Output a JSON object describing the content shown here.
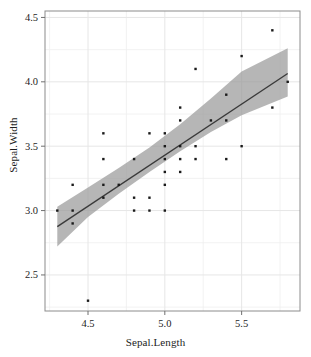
{
  "chart_data": {
    "type": "scatter",
    "title": "",
    "xlabel": "Sepal.Length",
    "ylabel": "Sepal.Width",
    "xlim": [
      4.22,
      5.88
    ],
    "ylim": [
      2.22,
      4.55
    ],
    "xticks": [
      4.5,
      5.0,
      5.5
    ],
    "xtick_labels": [
      "4.5",
      "5.0",
      "5.5"
    ],
    "yticks": [
      2.5,
      3.0,
      3.5,
      4.0,
      4.5
    ],
    "ytick_labels": [
      "2.5",
      "3.0",
      "3.5",
      "4.0",
      "4.5"
    ],
    "x_minor_ticks": [
      4.25,
      4.75,
      5.25,
      5.75
    ],
    "y_minor_ticks": [
      2.25,
      2.75,
      3.25,
      3.75,
      4.25
    ],
    "grid": true,
    "legend": "none",
    "point_color": "#1a1a1a",
    "point_size": 2.4,
    "line_color": "#3a3a3a",
    "band_color": "#9a9a9a",
    "band_opacity": 0.72,
    "grid_color": "#efefef",
    "border_color": "#8c8c8c",
    "background": "#ffffff",
    "points": [
      {
        "x": 4.3,
        "y": 3.0
      },
      {
        "x": 4.4,
        "y": 3.2
      },
      {
        "x": 4.4,
        "y": 3.0
      },
      {
        "x": 4.4,
        "y": 2.9
      },
      {
        "x": 4.5,
        "y": 2.3
      },
      {
        "x": 4.6,
        "y": 3.6
      },
      {
        "x": 4.6,
        "y": 3.4
      },
      {
        "x": 4.6,
        "y": 3.2
      },
      {
        "x": 4.6,
        "y": 3.1
      },
      {
        "x": 4.7,
        "y": 3.2
      },
      {
        "x": 4.8,
        "y": 3.4
      },
      {
        "x": 4.8,
        "y": 3.1
      },
      {
        "x": 4.8,
        "y": 3.0
      },
      {
        "x": 4.9,
        "y": 3.6
      },
      {
        "x": 4.9,
        "y": 3.1
      },
      {
        "x": 4.9,
        "y": 3.0
      },
      {
        "x": 5.0,
        "y": 3.6
      },
      {
        "x": 5.0,
        "y": 3.5
      },
      {
        "x": 5.0,
        "y": 3.4
      },
      {
        "x": 5.0,
        "y": 3.3
      },
      {
        "x": 5.0,
        "y": 3.2
      },
      {
        "x": 5.0,
        "y": 3.0
      },
      {
        "x": 5.1,
        "y": 3.8
      },
      {
        "x": 5.1,
        "y": 3.7
      },
      {
        "x": 5.1,
        "y": 3.5
      },
      {
        "x": 5.1,
        "y": 3.4
      },
      {
        "x": 5.1,
        "y": 3.3
      },
      {
        "x": 5.2,
        "y": 4.1
      },
      {
        "x": 5.2,
        "y": 3.5
      },
      {
        "x": 5.2,
        "y": 3.4
      },
      {
        "x": 5.3,
        "y": 3.7
      },
      {
        "x": 5.4,
        "y": 3.9
      },
      {
        "x": 5.4,
        "y": 3.7
      },
      {
        "x": 5.4,
        "y": 3.4
      },
      {
        "x": 5.5,
        "y": 4.2
      },
      {
        "x": 5.5,
        "y": 3.5
      },
      {
        "x": 5.7,
        "y": 4.4
      },
      {
        "x": 5.7,
        "y": 3.8
      },
      {
        "x": 5.8,
        "y": 4.0
      }
    ],
    "fit_line": {
      "name": "linear regression (lm)",
      "x_start": 4.3,
      "y_start": 2.875,
      "x_end": 5.8,
      "y_end": 4.065
    },
    "confidence_band": {
      "name": "95% confidence interval",
      "x": [
        4.3,
        4.5,
        4.7,
        4.9,
        5.1,
        5.3,
        5.5,
        5.8
      ],
      "lower": [
        2.72,
        2.95,
        3.13,
        3.3,
        3.46,
        3.61,
        3.74,
        3.885
      ],
      "upper": [
        3.03,
        3.18,
        3.33,
        3.49,
        3.67,
        3.87,
        4.08,
        4.26
      ]
    }
  }
}
